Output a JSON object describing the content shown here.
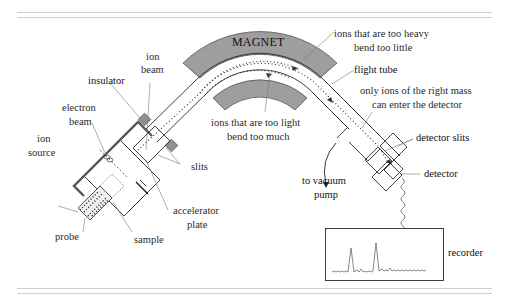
{
  "figure": {
    "colors": {
      "magnet_fill": "#9e9e9e",
      "insulator_fill": "#8f8f8f",
      "line": "#2a2a2a",
      "leader": "#777777",
      "rule": "#cfcfcf"
    }
  },
  "labels": {
    "magnet": "MAGNET",
    "ion_beam_1": "ion",
    "ion_beam_2": "beam",
    "insulator": "insulator",
    "electron_beam_1": "electron",
    "electron_beam_2": "beam",
    "ion_source_1": "ion",
    "ion_source_2": "source",
    "slits": "slits",
    "accelerator_plate_1": "accelerator",
    "accelerator_plate_2": "plate",
    "probe": "probe",
    "sample": "sample",
    "heavy_1": "ions that are too heavy",
    "heavy_2": "bend too little",
    "flight_tube": "flight tube",
    "light_1": "ions that are too light",
    "light_2": "bend too much",
    "right_mass_1": "only ions of the right mass",
    "right_mass_2": "can enter the detector",
    "detector_slits": "detector slits",
    "detector": "detector",
    "vacuum_1": "to vacuum",
    "vacuum_2": "pump",
    "recorder": "recorder"
  },
  "recorder_trace": {
    "peaks": [
      {
        "position": 0.22,
        "height": "tall"
      },
      {
        "position": 0.42,
        "height": "tallest"
      }
    ]
  }
}
